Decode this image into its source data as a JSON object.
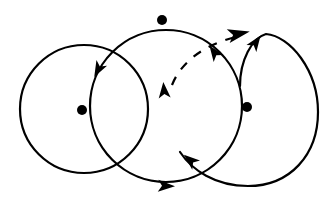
{
  "diagram": {
    "type": "three overlapping circular orbits with direction arrows",
    "colors": {
      "stroke": "#000000",
      "background": "#ffffff"
    },
    "circles": [
      {
        "name": "left-circle",
        "cx": 84,
        "cy": 109,
        "r": 64
      },
      {
        "name": "middle-circle",
        "cx": 165,
        "cy": 103,
        "r": 75
      },
      {
        "name": "right-loop",
        "cx": 247,
        "cy": 110,
        "r": 72
      }
    ],
    "dots": [
      {
        "name": "left-center-dot",
        "cx": 82,
        "cy": 110,
        "r": 5
      },
      {
        "name": "top-dot",
        "cx": 162,
        "cy": 20,
        "r": 5
      },
      {
        "name": "right-center-dot",
        "cx": 247,
        "cy": 107,
        "r": 5
      }
    ],
    "arrows": [
      {
        "name": "arrow-left-circle-down",
        "x": 97,
        "y": 70,
        "angle": 115
      },
      {
        "name": "arrow-middle-up",
        "x": 163,
        "y": 88,
        "angle": -88
      },
      {
        "name": "arrow-middle-upper-right",
        "x": 214,
        "y": 52,
        "angle": -125
      },
      {
        "name": "arrow-bottom-right",
        "x": 168,
        "y": 186,
        "angle": 5
      },
      {
        "name": "arrow-lower-middle",
        "x": 190,
        "y": 158,
        "angle": -130
      },
      {
        "name": "arrow-top-dashed-end",
        "x": 248,
        "y": 33,
        "angle": -10
      },
      {
        "name": "arrow-right-loop-up",
        "x": 256,
        "y": 42,
        "angle": -60
      }
    ]
  }
}
